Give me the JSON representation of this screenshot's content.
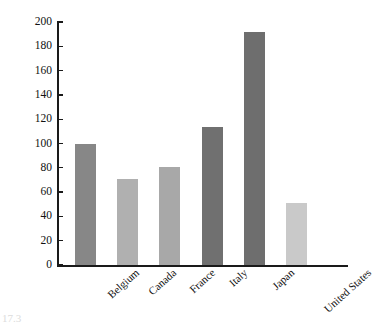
{
  "chart_data": {
    "type": "bar",
    "title": "",
    "xlabel": "",
    "ylabel": "Percent",
    "categories": [
      "Belgium",
      "Canada",
      "France",
      "Italy",
      "Japan",
      "United States"
    ],
    "values": [
      100,
      71,
      81,
      114,
      192,
      51
    ],
    "series": [
      {
        "name": "Percent",
        "values": [
          100,
          71,
          81,
          114,
          192,
          51
        ]
      }
    ],
    "bar_colors": [
      "#878787",
      "#b0b0b0",
      "#a8a8a8",
      "#707070",
      "#6e6e6e",
      "#c9c9c9"
    ],
    "ylim": [
      0,
      200
    ],
    "ytick_step": 20,
    "ytick_labels": [
      "0",
      "20",
      "40",
      "60",
      "80",
      "100",
      "120",
      "140",
      "160",
      "180",
      "200"
    ],
    "ytick_values": [
      0,
      20,
      40,
      60,
      80,
      100,
      120,
      140,
      160,
      180,
      200
    ],
    "grid": false,
    "legend": false,
    "legend_position": "none",
    "axis_color": "#1a1a1a",
    "background": "#ffffff",
    "xtick_rotation": -42
  },
  "figure": {
    "caption_fragment": "17.3"
  }
}
